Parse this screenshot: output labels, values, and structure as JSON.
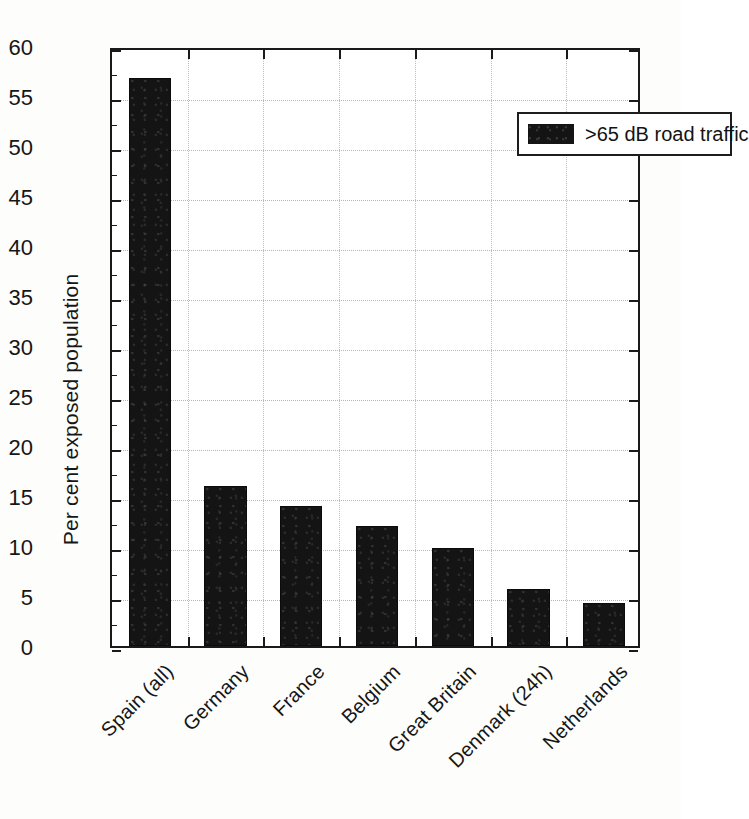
{
  "chart_data": {
    "type": "bar",
    "title": "",
    "subtitle": "",
    "xlabel": "",
    "ylabel": "Per cent exposed population",
    "categories": [
      "Spain (all)",
      "Germany",
      "France",
      "Belgium",
      "Great Britain",
      "Denmark (24h)",
      "Netherlands"
    ],
    "values": [
      56.8,
      16.0,
      14.0,
      12.0,
      9.8,
      5.7,
      4.3
    ],
    "series": [
      {
        "name": ">65 dB road traffic",
        "values": [
          56.8,
          16.0,
          14.0,
          12.0,
          9.8,
          5.7,
          4.3
        ],
        "color": "#141414"
      }
    ],
    "ylim": [
      0,
      60
    ],
    "ytick_step": 5,
    "yticks": [
      0,
      5,
      10,
      15,
      20,
      25,
      30,
      35,
      40,
      45,
      50,
      55,
      60
    ],
    "ytick_labels": [
      "0",
      "5",
      "10",
      "15",
      "20",
      "25",
      "30",
      "35",
      "40",
      "45",
      "50",
      "55",
      "60"
    ],
    "grid": true,
    "grid_style": "dotted",
    "legend_position": "top-right",
    "xtick_label_rotation": -45,
    "annotations": []
  },
  "legend": {
    "entries": [
      {
        "label": ">65 dB road traffic",
        "color": "#141414"
      }
    ]
  },
  "colors": {
    "bar": "#141414",
    "axis": "#1a1a1a",
    "grid": "#b8b8b8",
    "background": "#fdfdfb",
    "text": "#141414"
  }
}
